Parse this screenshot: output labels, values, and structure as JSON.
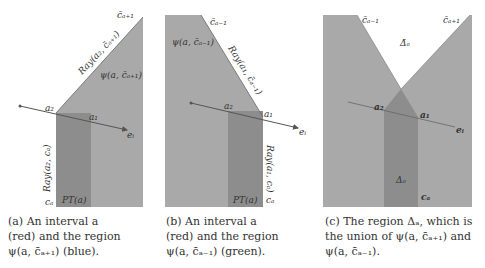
{
  "colors": {
    "region_light": "#a9a9a9",
    "region_dark": "#8d8d8d",
    "line": "#555555",
    "text": "#333333",
    "background": "#ffffff"
  },
  "panel_a": {
    "labels": {
      "top": "c̄ₐ₊₁",
      "ray_top": "Ray(a₂, c̄ₐ₊₁)",
      "region": "ψ(a, c̄ₐ₊₁)",
      "a2": "a₂",
      "a1": "a₁",
      "ei": "eᵢ",
      "ray_bottom": "Ray(a₂, cₐ)",
      "ca": "cₐ",
      "pt": "PT(a)"
    },
    "caption": [
      "(a)  An  interval  a",
      "(red)  and  the  region",
      "ψ(a, c̄ₐ₊₁) (blue)."
    ]
  },
  "panel_b": {
    "labels": {
      "top": "c̄ₐ₋₁",
      "region": "ψ(a, c̄ₐ₋₁)",
      "ray_top": "Ray(a₁, c̄ₐ₋₁)",
      "a2": "a₂",
      "a1": "a₁",
      "ei": "eᵢ",
      "ray_bottom": "Ray(a₁, cₐ)",
      "ca": "cₐ",
      "pt": "PT(a)"
    },
    "caption": [
      "(b)  An  interval  a",
      "(red)  and  the  region",
      "ψ(a, c̄ₐ₋₁) (green)."
    ]
  },
  "panel_c": {
    "labels": {
      "top_left": "c̄ₐ₋₁",
      "top_right": "c̄ₐ₊₁",
      "delta_bar": "Δ̄ₐ",
      "a2": "a₂",
      "a1": "a₁",
      "ei": "eᵢ",
      "delta": "Δₐ",
      "ca": "cₐ"
    },
    "caption": [
      "(c) The region Δₐ, which is",
      "the union of ψ(a, c̄ₐ₊₁) and",
      "ψ(a, c̄ₐ₋₁)."
    ]
  }
}
